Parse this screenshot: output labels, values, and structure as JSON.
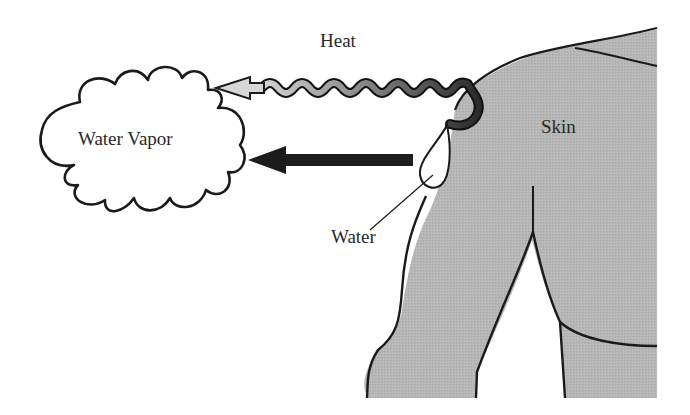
{
  "diagram": {
    "labels": {
      "heat": "Heat",
      "water_vapor": "Water Vapor",
      "skin": "Skin",
      "water": "Water"
    },
    "nodes": [
      {
        "id": "vapor",
        "shape": "cloud",
        "label": "Water Vapor"
      },
      {
        "id": "skin",
        "shape": "body-silhouette",
        "label": "Skin"
      },
      {
        "id": "water",
        "shape": "droplet",
        "label": "Water"
      }
    ],
    "edges": [
      {
        "from": "skin",
        "to": "vapor",
        "style": "wavy-gradient-arrow",
        "label": "Heat"
      },
      {
        "from": "water",
        "to": "vapor",
        "style": "solid-thick-arrow",
        "label": ""
      }
    ],
    "colors": {
      "skin_fill": "#b5b5b5",
      "outline": "#1a1a1a",
      "arrow_dark": "#1c1c1c",
      "heat_start": "#2a2a2a",
      "heat_end": "#cfcfcf"
    }
  }
}
